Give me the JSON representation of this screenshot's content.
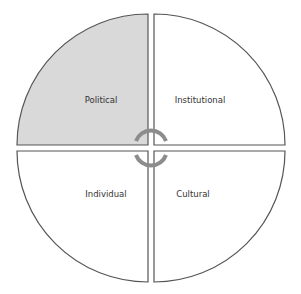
{
  "diagram": {
    "type": "four-quadrant-circle",
    "quadrants": [
      {
        "id": "top-left",
        "label": "Political",
        "fill": "#d9d9d9",
        "highlighted": true
      },
      {
        "id": "top-right",
        "label": "Institutional",
        "fill": "#ffffff",
        "highlighted": false
      },
      {
        "id": "bottom-left",
        "label": "Individual",
        "fill": "#ffffff",
        "highlighted": false
      },
      {
        "id": "bottom-right",
        "label": "Cultural",
        "fill": "#ffffff",
        "highlighted": false
      }
    ],
    "center_symbol": "cycle-arrows",
    "colors": {
      "stroke": "#555555",
      "highlight_fill": "#d9d9d9",
      "arc": "#8c8c8c",
      "text": "#333333"
    }
  }
}
